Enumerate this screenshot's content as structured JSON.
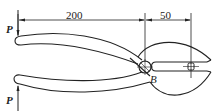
{
  "diagram": {
    "type": "pliers force diagram",
    "dimensions": [
      {
        "label": "200",
        "from": "handle-end",
        "to": "pivot-B"
      },
      {
        "label": "50",
        "from": "pivot-B",
        "to": "jaw-pin"
      }
    ],
    "forces": [
      {
        "label": "P",
        "position": "upper-handle",
        "direction": "down"
      },
      {
        "label": "P",
        "position": "lower-handle",
        "direction": "up"
      }
    ],
    "pivot_label": "B",
    "colors": {
      "line": "#222222",
      "background": "#ffffff"
    }
  },
  "labels": {
    "dim_200": "200",
    "dim_50": "50",
    "force_upper": "P",
    "force_lower": "P",
    "pivot": "B"
  }
}
